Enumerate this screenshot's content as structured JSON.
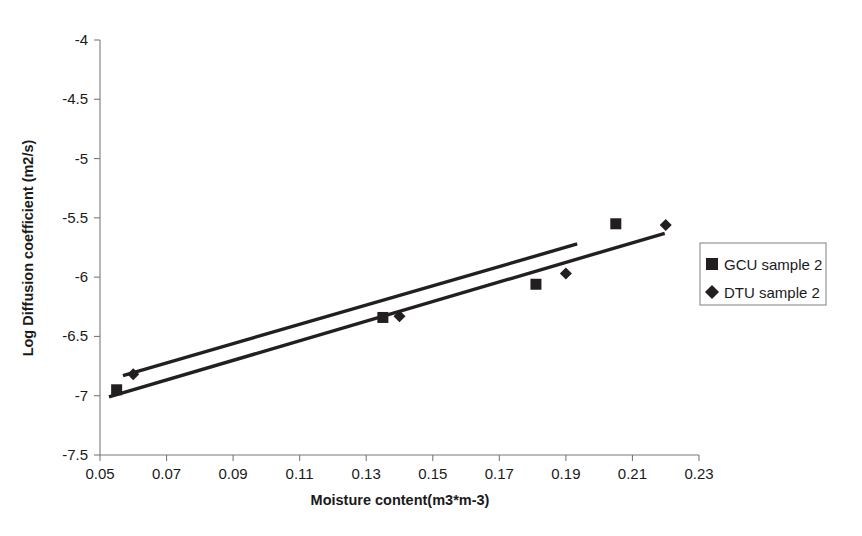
{
  "chart_data": {
    "type": "scatter",
    "title": "",
    "xlabel": "Moisture content(m3*m-3)",
    "ylabel": "Log Diffusion coefficient (m2/s)",
    "xlim": [
      0.05,
      0.23
    ],
    "ylim": [
      -7.5,
      -4.0
    ],
    "xticks": [
      "0.05",
      "0.07",
      "0.09",
      "0.11",
      "0.13",
      "0.15",
      "0.17",
      "0.19",
      "0.21",
      "0.23"
    ],
    "xtick_values": [
      0.05,
      0.07,
      0.09,
      0.11,
      0.13,
      0.15,
      0.17,
      0.19,
      0.21,
      0.23
    ],
    "yticks": [
      "-7.5",
      "-7",
      "-6.5",
      "-6",
      "-5.5",
      "-5",
      "-4.5",
      "-4"
    ],
    "ytick_values": [
      -7.5,
      -7.0,
      -6.5,
      -6.0,
      -5.5,
      -5.0,
      -4.5,
      -4.0
    ],
    "grid": false,
    "legend_position": "right",
    "series": [
      {
        "name": "GCU sample 2",
        "marker": "square",
        "color": "#231f20",
        "x": [
          0.055,
          0.135,
          0.181,
          0.205
        ],
        "y": [
          -6.95,
          -6.34,
          -6.06,
          -5.55
        ],
        "trendline": {
          "x0": 0.0527,
          "y0": -7.01,
          "x1": 0.2197,
          "y1": -5.63
        }
      },
      {
        "name": "DTU sample 2",
        "marker": "diamond",
        "color": "#231f20",
        "x": [
          0.06,
          0.14,
          0.19,
          0.22
        ],
        "y": [
          -6.82,
          -6.33,
          -5.97,
          -5.56
        ],
        "trendline": {
          "x0": 0.0569,
          "y0": -6.83,
          "x1": 0.1934,
          "y1": -5.72
        }
      }
    ]
  },
  "axes": {
    "x_axis_title": "Moisture content(m3*m-3)",
    "y_axis_title": "Log Diffusion coefficient (m2/s)"
  },
  "legend": {
    "entries": [
      {
        "label": "GCU sample 2",
        "marker": "square-marker-icon"
      },
      {
        "label": "DTU sample 2",
        "marker": "diamond-marker-icon"
      }
    ]
  }
}
